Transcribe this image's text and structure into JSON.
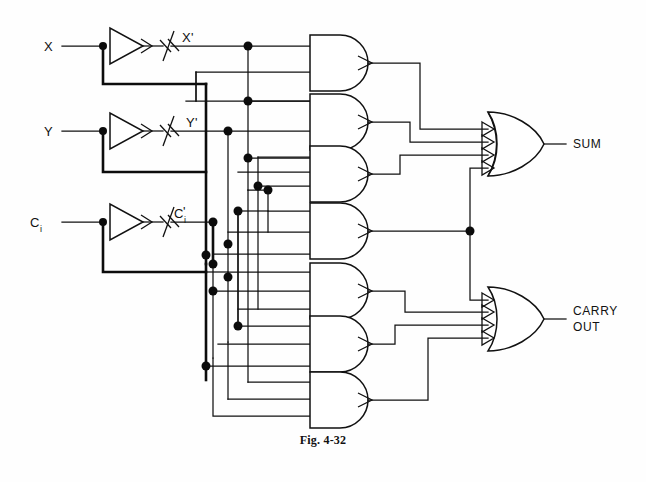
{
  "figure": {
    "caption": "Fig. 4-32"
  },
  "inputs": [
    {
      "name": "X",
      "label": "X",
      "sub": "",
      "y": 46
    },
    {
      "name": "Y",
      "label": "Y",
      "sub": "",
      "y": 131
    },
    {
      "name": "Ci",
      "label": "C",
      "sub": "i",
      "y": 222
    }
  ],
  "inverters": [
    {
      "name": "inverter-x",
      "input": "X",
      "output_label": "X",
      "output_sub": "",
      "output_prime": "'",
      "y": 46
    },
    {
      "name": "inverter-y",
      "input": "Y",
      "output_label": "Y",
      "output_sub": "",
      "output_prime": "'",
      "y": 131
    },
    {
      "name": "inverter-ci",
      "input": "C",
      "output_label": "C",
      "output_sub": "i",
      "output_prime": "'",
      "y": 222
    }
  ],
  "and_gates": [
    {
      "name": "and-gate-1",
      "index": 1,
      "inputs": 3,
      "y": 63,
      "feeds": "SUM"
    },
    {
      "name": "and-gate-2",
      "index": 2,
      "inputs": 3,
      "y": 122,
      "feeds": "SUM"
    },
    {
      "name": "and-gate-3",
      "index": 3,
      "inputs": 3,
      "y": 174,
      "feeds": "SUM"
    },
    {
      "name": "and-gate-4",
      "index": 4,
      "inputs": 3,
      "y": 231,
      "feeds": "SUM and CARRY OUT"
    },
    {
      "name": "and-gate-5",
      "index": 5,
      "inputs": 3,
      "y": 291,
      "feeds": "CARRY OUT"
    },
    {
      "name": "and-gate-6",
      "index": 6,
      "inputs": 3,
      "y": 344,
      "feeds": "CARRY OUT"
    },
    {
      "name": "and-gate-7",
      "index": 7,
      "inputs": 3,
      "y": 400,
      "feeds": "CARRY OUT"
    }
  ],
  "or_gates": [
    {
      "name": "or-gate-sum",
      "inputs": 4,
      "y": 143,
      "output_label": "SUM",
      "output_label2": ""
    },
    {
      "name": "or-gate-carry",
      "inputs": 4,
      "y": 318,
      "output_label": "CARRY",
      "output_label2": "OUT"
    }
  ],
  "outputs": [
    {
      "name": "sum-output",
      "label": "SUM"
    },
    {
      "name": "carry-output",
      "label_line1": "CARRY",
      "label_line2": "OUT"
    }
  ],
  "colors": {
    "wire": "#111111",
    "gate_fill": "#ffffff",
    "background": "#fefefe",
    "text": "#111111"
  },
  "counts": {
    "inverters": 3,
    "and_gates": 7,
    "or_gates": 2,
    "junction_dots": 22
  }
}
